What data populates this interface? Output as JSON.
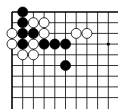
{
  "board": {
    "region": "top-left corner",
    "grid": {
      "origin_x": 12,
      "origin_y": 12,
      "spacing": 10.7,
      "cols": 10,
      "rows": 9
    },
    "colors": {
      "line": "#000000",
      "black_stone": "#000000",
      "white_stone": "#ffffff",
      "background": "#ffffff"
    },
    "black_stones": [
      [
        1,
        0
      ],
      [
        1,
        1
      ],
      [
        1,
        2
      ],
      [
        2,
        2
      ],
      [
        1,
        3
      ],
      [
        3,
        3
      ],
      [
        4,
        3
      ],
      [
        5,
        3
      ],
      [
        5,
        5
      ]
    ],
    "white_stones": [
      [
        2,
        1
      ],
      [
        3,
        1
      ],
      [
        0,
        2
      ],
      [
        3,
        2
      ],
      [
        0,
        3
      ],
      [
        2,
        3
      ],
      [
        1,
        4
      ],
      [
        2,
        4
      ],
      [
        6,
        2
      ],
      [
        7,
        2
      ]
    ],
    "star_points": [
      [
        9,
        3
      ]
    ]
  }
}
